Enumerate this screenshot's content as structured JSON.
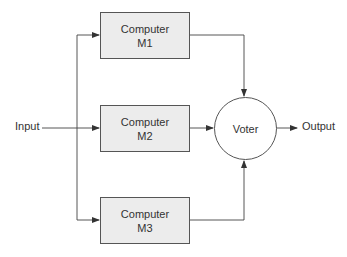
{
  "diagram": {
    "input_label": "Input",
    "output_label": "Output",
    "computers": [
      {
        "line1": "Computer",
        "line2": "M1"
      },
      {
        "line1": "Computer",
        "line2": "M2"
      },
      {
        "line1": "Computer",
        "line2": "M3"
      }
    ],
    "voter_label": "Voter",
    "colors": {
      "box_fill": "#ececec",
      "stroke": "#555555",
      "text": "#333333"
    }
  }
}
